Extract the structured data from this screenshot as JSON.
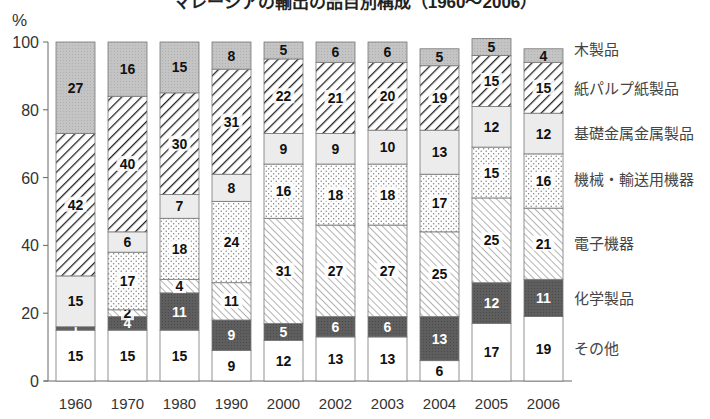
{
  "title": "マレーシアの輸出の品目別構成（1960〜2006）",
  "y_unit_label": "%",
  "chart_data": {
    "type": "bar",
    "stacked": true,
    "title": "マレーシアの輸出の品目別構成（1960〜2006）",
    "xlabel": "",
    "ylabel": "%",
    "ylim": [
      0,
      100
    ],
    "yticks": [
      0,
      20,
      40,
      60,
      80,
      100
    ],
    "categories": [
      "1960",
      "1970",
      "1980",
      "1990",
      "2000",
      "2002",
      "2003",
      "2004",
      "2005",
      "2006"
    ],
    "legend_position": "right",
    "series": [
      {
        "name": "その他",
        "pattern": "white",
        "values": [
          15,
          15,
          15,
          9,
          12,
          13,
          13,
          6,
          17,
          19
        ]
      },
      {
        "name": "化学製品",
        "pattern": "dark-gray",
        "values": [
          1,
          4,
          11,
          9,
          5,
          6,
          6,
          13,
          12,
          11
        ]
      },
      {
        "name": "電子機器",
        "pattern": "fine-diagonal-hatch",
        "values": [
          0,
          2,
          4,
          11,
          31,
          27,
          27,
          25,
          25,
          21
        ]
      },
      {
        "name": "機械・輸送用機器",
        "pattern": "dots",
        "values": [
          0,
          17,
          18,
          24,
          16,
          18,
          18,
          17,
          15,
          16
        ]
      },
      {
        "name": "基礎金属金属製品",
        "pattern": "light-gray",
        "values": [
          15,
          6,
          7,
          8,
          9,
          9,
          10,
          13,
          12,
          12
        ]
      },
      {
        "name": "紙パルプ紙製品",
        "pattern": "bold-diagonal-hatch",
        "values": [
          42,
          40,
          30,
          31,
          22,
          21,
          20,
          19,
          15,
          15
        ]
      },
      {
        "name": "木製品",
        "pattern": "mid-gray",
        "values": [
          27,
          16,
          15,
          8,
          5,
          6,
          6,
          5,
          5,
          4
        ]
      }
    ],
    "colors": {
      "white": "#ffffff",
      "dark_gray": "#5e5e5e",
      "light_gray": "#ececec",
      "mid_gray": "#c2c2c2",
      "hatch_line": "#222222",
      "axis": "#666666"
    }
  }
}
